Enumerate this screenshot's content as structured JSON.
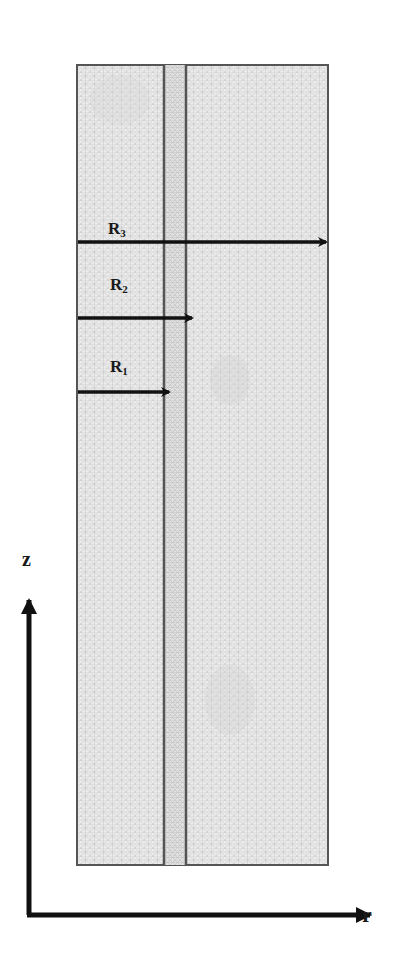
{
  "diagram": {
    "type": "axisymmetric finite-element mesh domain",
    "colors": {
      "background": "#ffffff",
      "mesh_fill": "#e9e9e9",
      "mesh_line": "#c8c8c8",
      "boundary": "#555555",
      "arrow": "#111111"
    },
    "radii": [
      {
        "label": "R",
        "sub": "1"
      },
      {
        "label": "R",
        "sub": "2"
      },
      {
        "label": "R",
        "sub": "3"
      }
    ],
    "axes": {
      "vertical_label": "z",
      "horizontal_label": "r"
    }
  }
}
